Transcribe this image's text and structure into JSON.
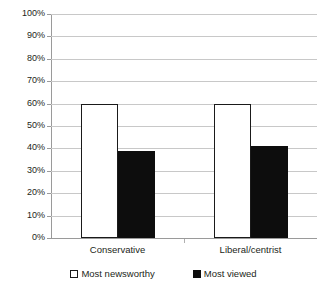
{
  "chart_data": {
    "type": "bar",
    "title": "",
    "subtitle": "",
    "xlabel": "",
    "ylabel": "",
    "categories": [
      "Conservative",
      "Liberal/centrist"
    ],
    "series": [
      {
        "name": "Most newsworthy",
        "values": [
          60,
          60
        ],
        "color": "#ffffff",
        "border_color": "#1a1a1a"
      },
      {
        "name": "Most viewed",
        "values": [
          39,
          41
        ],
        "color": "#0d0d0d",
        "border_color": "#0d0d0d"
      }
    ],
    "ylim": [
      0,
      100
    ],
    "ytick_step": 10,
    "ytick_labels": [
      "0%",
      "10%",
      "20%",
      "30%",
      "40%",
      "50%",
      "60%",
      "70%",
      "80%",
      "90%",
      "100%"
    ],
    "ytick_values": [
      0,
      10,
      20,
      30,
      40,
      50,
      60,
      70,
      80,
      90,
      100
    ],
    "value_suffix": "%",
    "grid": true,
    "grid_axis": "y",
    "grid_color": "#c8c8c8",
    "legend": true,
    "legend_position": "bottom",
    "axis_color": "#9a9a9a",
    "background": "#ffffff",
    "text_color": "#231f20"
  }
}
